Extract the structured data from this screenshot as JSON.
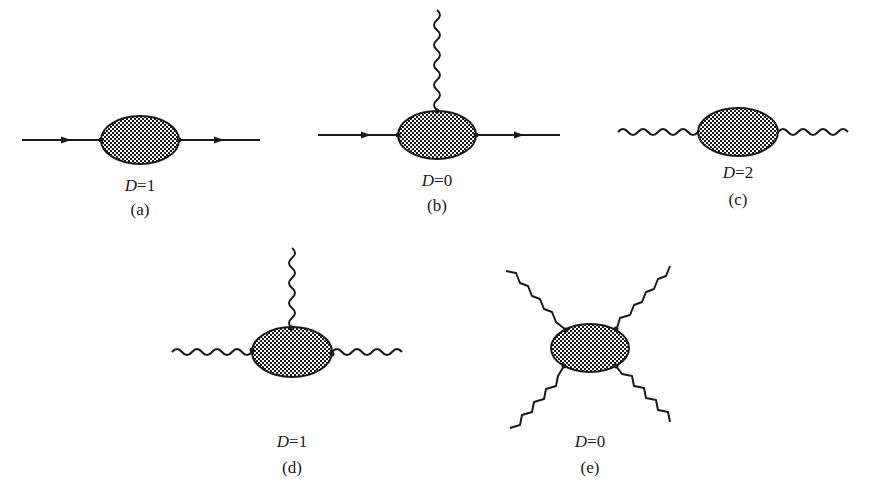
{
  "diagrams": [
    {
      "id": "a",
      "caption": "(a)",
      "label_D": "D",
      "label_eq": "=",
      "label_val": "1",
      "external_lines": [
        "fermion-in",
        "fermion-out"
      ]
    },
    {
      "id": "b",
      "caption": "(b)",
      "label_D": "D",
      "label_eq": "=",
      "label_val": "0",
      "external_lines": [
        "fermion-in",
        "fermion-out",
        "photon-up"
      ]
    },
    {
      "id": "c",
      "caption": "(c)",
      "label_D": "D",
      "label_eq": "=",
      "label_val": "2",
      "external_lines": [
        "photon-left",
        "photon-right"
      ]
    },
    {
      "id": "d",
      "caption": "(d)",
      "label_D": "D",
      "label_eq": "=",
      "label_val": "1",
      "external_lines": [
        "photon-left",
        "photon-right",
        "photon-up"
      ]
    },
    {
      "id": "e",
      "caption": "(e)",
      "label_D": "D",
      "label_eq": "=",
      "label_val": "0",
      "external_lines": [
        "photon-upper-left",
        "photon-upper-right",
        "photon-lower-left",
        "photon-lower-right"
      ]
    }
  ],
  "colors": {
    "ink": "#1a1a1a",
    "background": "#ffffff"
  }
}
